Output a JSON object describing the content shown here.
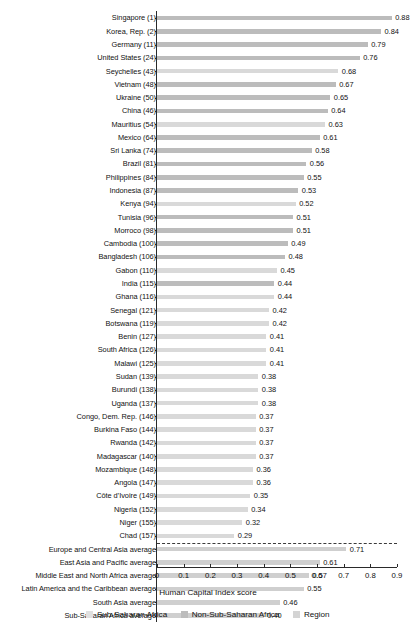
{
  "chart_data": {
    "type": "bar",
    "orientation": "horizontal",
    "title": "",
    "xlabel": "Human Capital Index score",
    "ylabel": "",
    "xlim": [
      0,
      0.9
    ],
    "xticks": [
      "0",
      "0.1",
      "0.2",
      "0.3",
      "0.4",
      "0.5",
      "0.6",
      "0.7",
      "0.8",
      "0.9"
    ],
    "xtick_values": [
      0,
      0.1,
      0.2,
      0.3,
      0.4,
      0.5,
      0.6,
      0.7,
      0.8,
      0.9
    ],
    "grid": false,
    "legend_position": "bottom",
    "legend": [
      {
        "label": "Sub-Saharan Africa",
        "color": "#e0e0e0",
        "key": "ssa"
      },
      {
        "label": "Non-Sub-Saharan Africa",
        "color": "#bcbcbc",
        "key": "nonssa"
      },
      {
        "label": "Region",
        "color": "#d4d4d4",
        "key": "region"
      }
    ],
    "categories": [
      "Singapore (1)",
      "Korea, Rep. (2)",
      "Germany (11)",
      "United States (24)",
      "Seychelles (43)",
      "Vietnam (48)",
      "Ukraine (50)",
      "China (46)",
      "Mauritius (54)",
      "Mexico (64)",
      "Sri Lanka (74)",
      "Brazil (81)",
      "Philippines (84)",
      "Indonesia (87)",
      "Kenya (94)",
      "Tunisia (96)",
      "Morroco (98)",
      "Cambodia (100)",
      "Bangladesh (106)",
      "Gabon (110)",
      "India (115)",
      "Ghana (116)",
      "Senegal (121)",
      "Botswana (119)",
      "Benin (127)",
      "South Africa (126)",
      "Malawi (125)",
      "Sudan (139)",
      "Burundi (138)",
      "Uganda (137)",
      "Congo, Dem. Rep. (146)",
      "Burkina Faso (144)",
      "Rwanda (142)",
      "Madagascar (140)",
      "Mozambique (148)",
      "Angola (147)",
      "Côte d’Ivoire (149)",
      "Nigeria (152)",
      "Niger (155)",
      "Chad (157)",
      "Europe and Central Asia average",
      "East Asia and Pacific average",
      "Middle East and North Africa average",
      "Latin America and the Caribbean average",
      "South Asia average",
      "Sub-Saharan Africa average"
    ],
    "values": [
      0.88,
      0.84,
      0.79,
      0.76,
      0.68,
      0.67,
      0.65,
      0.64,
      0.63,
      0.61,
      0.58,
      0.56,
      0.55,
      0.53,
      0.52,
      0.51,
      0.51,
      0.49,
      0.48,
      0.45,
      0.44,
      0.44,
      0.42,
      0.42,
      0.41,
      0.41,
      0.41,
      0.38,
      0.38,
      0.38,
      0.37,
      0.37,
      0.37,
      0.37,
      0.36,
      0.36,
      0.35,
      0.34,
      0.32,
      0.29,
      0.71,
      0.61,
      0.57,
      0.55,
      0.46,
      0.4
    ],
    "value_labels": [
      "0.88",
      "0.84",
      "0.79",
      "0.76",
      "0.68",
      "0.67",
      "0.65",
      "0.64",
      "0.63",
      "0.61",
      "0.58",
      "0.56",
      "0.55",
      "0.53",
      "0.52",
      "0.51",
      "0.51",
      "0.49",
      "0.48",
      "0.45",
      "0.44",
      "0.44",
      "0.42",
      "0.42",
      "0.41",
      "0.41",
      "0.41",
      "0.38",
      "0.38",
      "0.38",
      "0.37",
      "0.37",
      "0.37",
      "0.37",
      "0.36",
      "0.36",
      "0.35",
      "0.34",
      "0.32",
      "0.29",
      "0.71",
      "0.61",
      "0.57",
      "0.55",
      "0.46",
      "0.40"
    ],
    "series_key": [
      "nonssa",
      "nonssa",
      "nonssa",
      "nonssa",
      "ssa",
      "nonssa",
      "nonssa",
      "nonssa",
      "ssa",
      "nonssa",
      "nonssa",
      "nonssa",
      "nonssa",
      "nonssa",
      "ssa",
      "nonssa",
      "nonssa",
      "nonssa",
      "nonssa",
      "ssa",
      "nonssa",
      "ssa",
      "ssa",
      "ssa",
      "ssa",
      "ssa",
      "ssa",
      "ssa",
      "ssa",
      "ssa",
      "ssa",
      "ssa",
      "ssa",
      "ssa",
      "ssa",
      "ssa",
      "ssa",
      "ssa",
      "ssa",
      "ssa",
      "region",
      "region",
      "region",
      "region",
      "region",
      "region"
    ],
    "group_break_after_index": 39
  }
}
